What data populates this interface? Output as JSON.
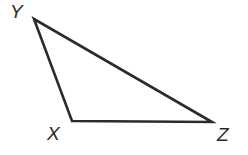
{
  "figure": {
    "type": "geometry-diagram",
    "shape": "triangle",
    "name": "Triangle XYZ",
    "background_color": "#ffffff",
    "stroke_color": "#2b2b2b",
    "stroke_width": 2.6,
    "label_color": "#2b2b2b"
  },
  "vertices": [
    {
      "id": "Y",
      "label": "Y",
      "x": 34,
      "y": 19,
      "label_x": 10,
      "label_y": 2
    },
    {
      "id": "X",
      "label": "X",
      "x": 72,
      "y": 121,
      "label_x": 47,
      "label_y": 124
    },
    {
      "id": "Z",
      "label": "Z",
      "x": 212,
      "y": 122,
      "label_x": 217,
      "label_y": 125
    }
  ],
  "edges": [
    {
      "id": "YX",
      "from": "Y",
      "to": "X",
      "label": ""
    },
    {
      "id": "XZ",
      "from": "X",
      "to": "Z",
      "label": ""
    },
    {
      "id": "ZY",
      "from": "Z",
      "to": "Y",
      "label": ""
    }
  ],
  "path": "M 34 19 L 72 121 L 212 122 Z"
}
